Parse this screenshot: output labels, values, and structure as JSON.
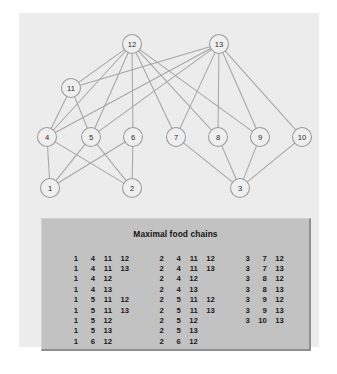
{
  "figure": {
    "background_color": "#ffffff",
    "panel_color": "#ececec"
  },
  "graph": {
    "name": "food-web-graph",
    "node_fill": "#efefef",
    "node_stroke": "#9a9a9a",
    "edge_color": "#a6a6a6",
    "nodes": [
      {
        "id": "1",
        "label": "1",
        "cx": 31,
        "cy": 175
      },
      {
        "id": "2",
        "label": "2",
        "cx": 113,
        "cy": 175
      },
      {
        "id": "3",
        "label": "3",
        "cx": 221,
        "cy": 175
      },
      {
        "id": "4",
        "label": "4",
        "cx": 28,
        "cy": 124
      },
      {
        "id": "5",
        "label": "5",
        "cx": 72,
        "cy": 124
      },
      {
        "id": "6",
        "label": "6",
        "cx": 114,
        "cy": 124
      },
      {
        "id": "7",
        "label": "7",
        "cx": 157,
        "cy": 124
      },
      {
        "id": "8",
        "label": "8",
        "cx": 199,
        "cy": 124
      },
      {
        "id": "9",
        "label": "9",
        "cx": 241,
        "cy": 124
      },
      {
        "id": "10",
        "label": "10",
        "cx": 283,
        "cy": 124
      },
      {
        "id": "11",
        "label": "11",
        "cx": 52,
        "cy": 75
      },
      {
        "id": "12",
        "label": "12",
        "cx": 113,
        "cy": 31
      },
      {
        "id": "13",
        "label": "13",
        "cx": 200,
        "cy": 31
      }
    ],
    "edges": [
      [
        "1",
        "4"
      ],
      [
        "1",
        "5"
      ],
      [
        "1",
        "6"
      ],
      [
        "2",
        "4"
      ],
      [
        "2",
        "5"
      ],
      [
        "2",
        "6"
      ],
      [
        "3",
        "7"
      ],
      [
        "3",
        "8"
      ],
      [
        "3",
        "9"
      ],
      [
        "3",
        "10"
      ],
      [
        "4",
        "11"
      ],
      [
        "4",
        "12"
      ],
      [
        "4",
        "13"
      ],
      [
        "5",
        "11"
      ],
      [
        "5",
        "12"
      ],
      [
        "5",
        "13"
      ],
      [
        "6",
        "12"
      ],
      [
        "7",
        "12"
      ],
      [
        "7",
        "13"
      ],
      [
        "8",
        "12"
      ],
      [
        "8",
        "13"
      ],
      [
        "9",
        "12"
      ],
      [
        "9",
        "13"
      ],
      [
        "10",
        "13"
      ],
      [
        "11",
        "12"
      ],
      [
        "11",
        "13"
      ]
    ]
  },
  "table": {
    "title": "Maximal food chains",
    "background_color": "#c2c2c2",
    "columns": [
      {
        "name": "chains-column-1",
        "rows": [
          [
            "1",
            "4",
            "11",
            "12"
          ],
          [
            "1",
            "4",
            "11",
            "13"
          ],
          [
            "1",
            "4",
            "12",
            ""
          ],
          [
            "1",
            "4",
            "13",
            ""
          ],
          [
            "1",
            "5",
            "11",
            "12"
          ],
          [
            "1",
            "5",
            "11",
            "13"
          ],
          [
            "1",
            "5",
            "12",
            ""
          ],
          [
            "1",
            "5",
            "13",
            ""
          ],
          [
            "1",
            "6",
            "12",
            ""
          ]
        ]
      },
      {
        "name": "chains-column-2",
        "rows": [
          [
            "2",
            "4",
            "11",
            "12"
          ],
          [
            "2",
            "4",
            "11",
            "13"
          ],
          [
            "2",
            "4",
            "12",
            ""
          ],
          [
            "2",
            "4",
            "13",
            ""
          ],
          [
            "2",
            "5",
            "11",
            "12"
          ],
          [
            "2",
            "5",
            "11",
            "13"
          ],
          [
            "2",
            "5",
            "12",
            ""
          ],
          [
            "2",
            "5",
            "13",
            ""
          ],
          [
            "2",
            "6",
            "12",
            ""
          ]
        ]
      },
      {
        "name": "chains-column-3",
        "rows": [
          [
            "3",
            "7",
            "12",
            ""
          ],
          [
            "3",
            "7",
            "13",
            ""
          ],
          [
            "3",
            "8",
            "12",
            ""
          ],
          [
            "3",
            "8",
            "13",
            ""
          ],
          [
            "3",
            "9",
            "12",
            ""
          ],
          [
            "3",
            "9",
            "13",
            ""
          ],
          [
            "3",
            "10",
            "13",
            ""
          ]
        ]
      }
    ]
  }
}
